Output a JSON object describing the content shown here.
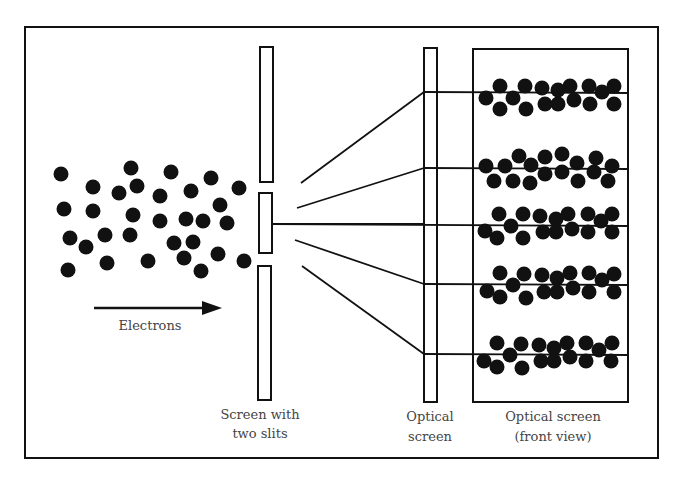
{
  "diagram": {
    "colors": {
      "ink": "#111111",
      "label": "#444444",
      "background": "#ffffff"
    },
    "labels": {
      "electrons": "Electrons",
      "slit_screen_line1": "Screen with",
      "slit_screen_line2": "two slits",
      "optical_screen_line1": "Optical",
      "optical_screen_line2": "screen",
      "front_view_line1": "Optical screen",
      "front_view_line2": "(front view)"
    },
    "components": [
      {
        "id": "electron-source",
        "name": "Electron beam",
        "description": "cloud of electrons moving right"
      },
      {
        "id": "slit-screen",
        "name": "Screen with two slits"
      },
      {
        "id": "optical-screen",
        "name": "Optical screen (side)"
      },
      {
        "id": "optical-screen-front",
        "name": "Optical screen (front view)",
        "bands": 5
      }
    ],
    "band_count": 5
  }
}
